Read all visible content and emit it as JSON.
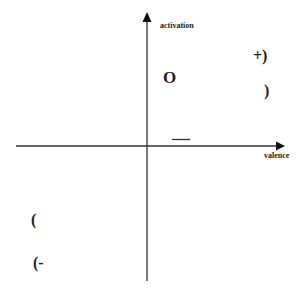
{
  "diagram": {
    "type": "circumplex-axes",
    "axes": {
      "y_label": "activation",
      "x_label": "valence"
    },
    "symbols": [
      {
        "id": "plus-paren",
        "text": "+)"
      },
      {
        "id": "circle-o",
        "text": "O"
      },
      {
        "id": "close-paren",
        "text": ")"
      },
      {
        "id": "dash",
        "text": "—"
      },
      {
        "id": "open-paren",
        "text": "("
      },
      {
        "id": "open-paren-minus",
        "text": "(-"
      }
    ]
  }
}
